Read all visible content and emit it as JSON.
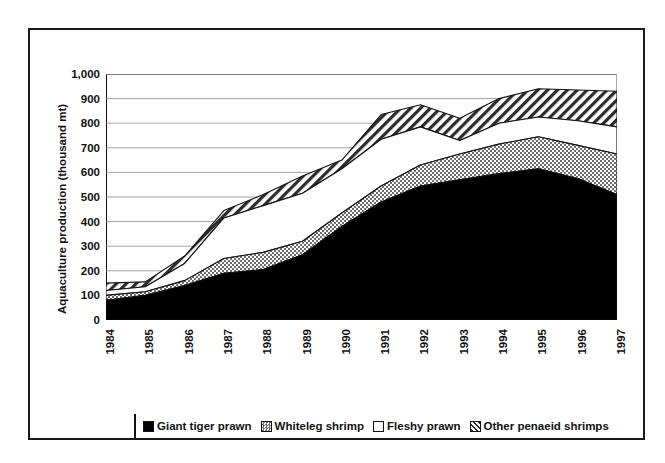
{
  "chart_data": {
    "type": "area",
    "stacked": true,
    "title": "",
    "xlabel": "",
    "ylabel": "Aquaculture production (thousand mt)",
    "categories": [
      "1984",
      "1985",
      "1986",
      "1987",
      "1988",
      "1989",
      "1990",
      "1991",
      "1992",
      "1993",
      "1994",
      "1995",
      "1996",
      "1997"
    ],
    "ylim": [
      0,
      1000
    ],
    "ytick_step": 100,
    "yticks": [
      "0",
      "100",
      "200",
      "300",
      "400",
      "500",
      "600",
      "700",
      "800",
      "900",
      "1,000"
    ],
    "grid": "horizontal",
    "legend_position": "bottom",
    "series": [
      {
        "name": "Giant tiger prawn",
        "fill": "solid-black",
        "color": "#000000",
        "values": [
          80,
          100,
          140,
          190,
          205,
          265,
          380,
          480,
          545,
          570,
          595,
          615,
          575,
          510
        ]
      },
      {
        "name": "Whiteleg shrimp",
        "fill": "stipple-gray",
        "color": "#b4b4b4",
        "values": [
          20,
          15,
          20,
          60,
          70,
          55,
          55,
          65,
          85,
          105,
          120,
          130,
          135,
          165
        ]
      },
      {
        "name": "Fleshy prawn",
        "fill": "white",
        "color": "#ffffff",
        "values": [
          20,
          20,
          70,
          165,
          190,
          195,
          180,
          190,
          155,
          55,
          85,
          80,
          100,
          110
        ]
      },
      {
        "name": "Other penaeid shrimps",
        "fill": "diagonal-hatch",
        "color": "#ffffff",
        "values": [
          30,
          20,
          30,
          30,
          45,
          70,
          35,
          100,
          90,
          90,
          100,
          115,
          125,
          145
        ]
      }
    ],
    "totals": [
      150,
      155,
      260,
      445,
      510,
      585,
      650,
      835,
      875,
      820,
      900,
      940,
      935,
      930
    ]
  },
  "legend": {
    "items": [
      {
        "label": "Giant tiger prawn",
        "fill": "solid-black"
      },
      {
        "label": "Whiteleg shrimp",
        "fill": "stipple-gray"
      },
      {
        "label": "Fleshy prawn",
        "fill": "white"
      },
      {
        "label": "Other penaeid shrimps",
        "fill": "diagonal-hatch"
      }
    ]
  }
}
